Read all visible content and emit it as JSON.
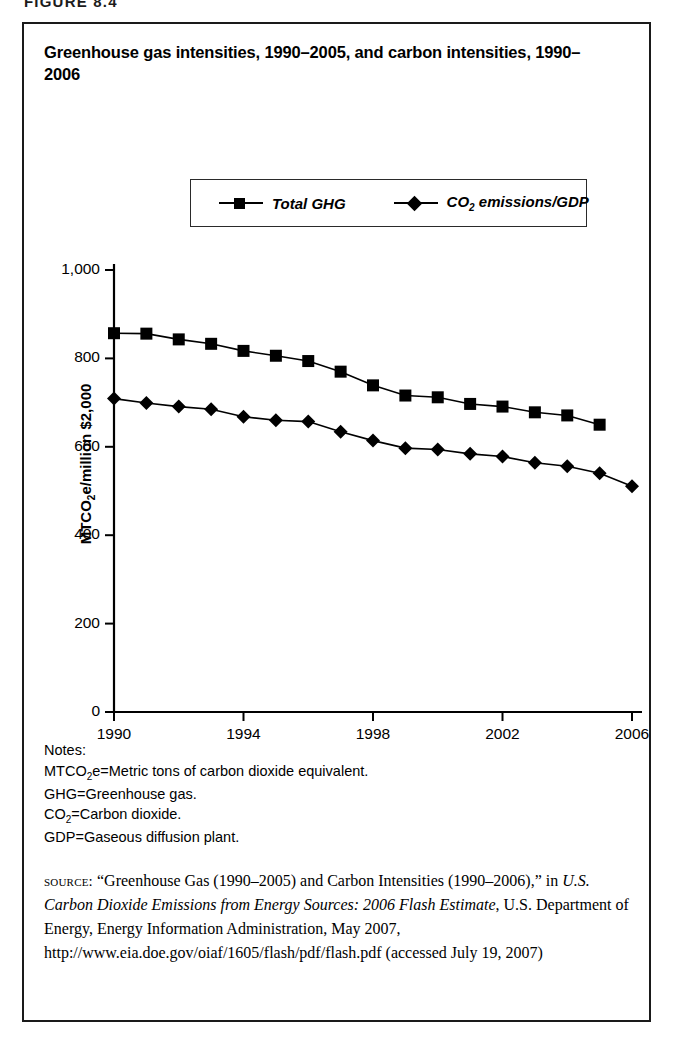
{
  "figure_head": "FIGURE 8.4",
  "title": "Greenhouse gas intensities, 1990–2005, and carbon intensities, 1990–2006",
  "legend": {
    "ghg_label": "Total GHG",
    "co2_label_main": "CO",
    "co2_label_sub": "2",
    "co2_label_rest": " emissions/GDP"
  },
  "axis": {
    "y_title_pre": "MTCO",
    "y_title_sub": "2",
    "y_title_post": "e/million $2,000",
    "y_ticks": [
      "0",
      "200",
      "400",
      "600",
      "800",
      "1,000"
    ],
    "x_ticks": [
      "1990",
      "1994",
      "1998",
      "2002",
      "2006"
    ]
  },
  "notes": {
    "heading": "Notes:",
    "line1_pre": "MTCO",
    "line1_sub": "2",
    "line1_post": "e=Metric tons of carbon dioxide equivalent.",
    "line2": "GHG=Greenhouse gas.",
    "line3_pre": "CO",
    "line3_sub": "2",
    "line3_post": "=Carbon dioxide.",
    "line4": "GDP=Gaseous diffusion plant."
  },
  "source": {
    "label": "source:",
    "text_part1": " “Greenhouse Gas (1990–2005) and Carbon Intensities (1990–2006),” in ",
    "italic1": "U.S. Carbon Dioxide Emissions from Energy Sources: 2006 Flash Estimate",
    "text_part2": ", U.S. Department of Energy, Energy Information Administration, May 2007, http://www.eia.doe.gov/oiaf/1605/flash/pdf/flash.pdf (accessed July 19, 2007)"
  },
  "colors": {
    "ink": "#000000",
    "border": "#1a1a1a",
    "series_ghg": "#000000",
    "series_co2": "#000000"
  },
  "chart_data": {
    "type": "line",
    "title": "Greenhouse gas intensities, 1990–2005, and carbon intensities, 1990–2006",
    "xlabel": "",
    "ylabel": "MTCO2e/million $2,000",
    "xlim": [
      1990,
      2006
    ],
    "ylim": [
      0,
      1000
    ],
    "ytick_values": [
      0,
      200,
      400,
      600,
      800,
      1000
    ],
    "xtick_values": [
      1990,
      1994,
      1998,
      2002,
      2006
    ],
    "grid": false,
    "legend_position": "top-center",
    "series": [
      {
        "name": "Total GHG",
        "marker": "square",
        "x": [
          1990,
          1991,
          1992,
          1993,
          1994,
          1995,
          1996,
          1997,
          1998,
          1999,
          2000,
          2001,
          2002,
          2003,
          2004,
          2005
        ],
        "values": [
          857,
          856,
          843,
          833,
          817,
          806,
          794,
          770,
          739,
          716,
          712,
          697,
          691,
          678,
          671,
          650
        ]
      },
      {
        "name": "CO2 emissions/GDP",
        "marker": "diamond",
        "x": [
          1990,
          1991,
          1992,
          1993,
          1994,
          1995,
          1996,
          1997,
          1998,
          1999,
          2000,
          2001,
          2002,
          2003,
          2004,
          2005,
          2006
        ],
        "values": [
          709,
          699,
          691,
          685,
          668,
          660,
          657,
          634,
          614,
          597,
          594,
          584,
          578,
          564,
          556,
          540,
          511
        ]
      }
    ]
  }
}
